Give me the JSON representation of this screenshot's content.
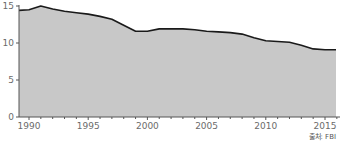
{
  "chart_data": {
    "type": "area",
    "title": "",
    "xlabel": "",
    "ylabel": "",
    "x": [
      1989,
      1990,
      1991,
      1992,
      1993,
      1994,
      1995,
      1996,
      1997,
      1998,
      1999,
      2000,
      2001,
      2002,
      2003,
      2004,
      2005,
      2006,
      2007,
      2008,
      2009,
      2010,
      2011,
      2012,
      2013,
      2014,
      2015,
      2016
    ],
    "series": [
      {
        "name": "value",
        "values": [
          14.4,
          14.5,
          15.0,
          14.6,
          14.3,
          14.1,
          13.9,
          13.6,
          13.2,
          12.4,
          11.6,
          11.6,
          11.9,
          11.9,
          11.9,
          11.8,
          11.6,
          11.5,
          11.4,
          11.2,
          10.7,
          10.3,
          10.2,
          10.1,
          9.7,
          9.2,
          9.1,
          9.1
        ]
      }
    ],
    "xlim": [
      1989,
      2016
    ],
    "ylim": [
      0,
      15
    ],
    "x_ticks": [
      1990,
      1995,
      2000,
      2005,
      2010,
      2015
    ],
    "y_ticks": [
      0,
      5,
      10,
      15
    ],
    "grid": false,
    "legend": null,
    "fill_color": "#c8c8c8",
    "line_color": "#1a1a1a",
    "annotations": []
  },
  "source_label": "출처: FBI"
}
